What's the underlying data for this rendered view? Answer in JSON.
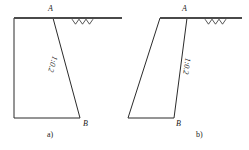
{
  "figure": {
    "type": "engineering-diagram",
    "line_color": "#2b2b2b",
    "ground_color": "#4a4a4a",
    "background": "#ffffff",
    "panels": [
      {
        "id": "a",
        "caption": "a)",
        "caption_pos": {
          "x": 47,
          "y": 131
        },
        "slope_label": "1:0.2",
        "slope_label_pos": {
          "x": 44,
          "y": 60
        },
        "slope_label_rotation": -74,
        "vertices": [
          {
            "name": "A",
            "label": "A",
            "x": 53,
            "y": 18,
            "label_x": 48,
            "label_y": 5
          },
          {
            "name": "B",
            "label": "B",
            "x": 80,
            "y": 118,
            "label_x": 83,
            "label_y": 120
          }
        ],
        "outline_points": "14,18 53,18 80,118 14,118",
        "ground_line": {
          "x1": 14,
          "y1": 18,
          "x2": 122,
          "y2": 18
        },
        "hatch_start_x": 72,
        "hatch_count": 3
      },
      {
        "id": "b",
        "caption": "b)",
        "caption_pos": {
          "x": 196,
          "y": 131
        },
        "slope_label": "1:0.2",
        "slope_label_pos": {
          "x": 178,
          "y": 62
        },
        "slope_label_rotation": -82,
        "vertices": [
          {
            "name": "A",
            "label": "A",
            "x": 187,
            "y": 18,
            "label_x": 182,
            "label_y": 5
          },
          {
            "name": "B",
            "label": "B",
            "x": 174,
            "y": 118,
            "label_x": 176,
            "label_y": 120
          }
        ],
        "outline_points": "160,18 187,18 174,118 128,118",
        "ground_line": {
          "x1": 160,
          "y1": 18,
          "x2": 242,
          "y2": 18
        },
        "hatch_start_x": 205,
        "hatch_count": 3
      }
    ]
  }
}
